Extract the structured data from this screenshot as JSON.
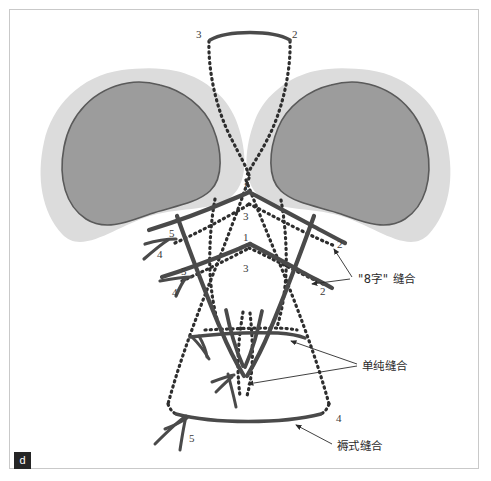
{
  "figure": {
    "panel_tag": "d",
    "colors": {
      "organ_fill": "#9c9c9c",
      "organ_outline": "#5a5a5a",
      "organ_halo": "#dcdcdc",
      "suture_solid": "#4a4a4a",
      "suture_dotted": "#2e2e2e",
      "frame_border": "#c9c9c9",
      "background": "#ffffff",
      "label_text": "#2b2b2b",
      "panel_tag_bg": "#252525"
    }
  },
  "annotations": {
    "figure_eight_suture": "\"8字\" 缝合",
    "simple_suture": "单纯缝合",
    "mattress_suture": "褥式缝合"
  },
  "numbers": {
    "top_left": "3",
    "top_right": "2",
    "center_upper": "1",
    "center_mid_upper": "3",
    "center_mid": "1",
    "center_lower": "3",
    "left_upper_5": "5",
    "left_upper_4": "4",
    "left_lower_5": "5",
    "left_lower_4": "4",
    "right_upper_2": "2",
    "right_lower_2": "2",
    "bottom_left_5": "5",
    "bottom_right_4": "4"
  }
}
